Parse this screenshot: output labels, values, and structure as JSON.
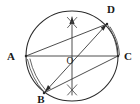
{
  "figure": {
    "kind": "circle-geometry-construction",
    "background_color": "#ffffff",
    "ink_color": "#2b2b2b",
    "width": 140,
    "height": 104,
    "circle": {
      "name": "main-circle",
      "center_x": 72,
      "center_y": 56,
      "radius_x": 46,
      "radius_y": 45
    },
    "points": [
      {
        "id": "A",
        "label": "A",
        "x": 26,
        "y": 56,
        "label_x": 13,
        "label_y": 60
      },
      {
        "id": "B",
        "label": "B",
        "x": 44,
        "y": 93,
        "label_x": 38,
        "label_y": 103
      },
      {
        "id": "C",
        "label": "C",
        "x": 118,
        "y": 56,
        "label_x": 123,
        "label_y": 60
      },
      {
        "id": "D",
        "label": "D",
        "x": 107,
        "y": 24,
        "label_x": 108,
        "label_y": 13
      },
      {
        "id": "O",
        "label": "O",
        "x": 72,
        "y": 56,
        "label_x": 67,
        "label_y": 63
      }
    ],
    "chords": [
      {
        "name": "chord-AC-diameter",
        "from": "A",
        "to": "C",
        "x1": 26,
        "y1": 56,
        "x2": 118,
        "y2": 56
      },
      {
        "name": "chord-AD",
        "from": "A",
        "to": "D",
        "x1": 26,
        "y1": 56,
        "x2": 107,
        "y2": 24
      },
      {
        "name": "chord-BC",
        "from": "B",
        "to": "C",
        "x1": 44,
        "y1": 93,
        "x2": 118,
        "y2": 56
      },
      {
        "name": "chord-BD",
        "from": "B",
        "to": "D",
        "x1": 44,
        "y1": 93,
        "x2": 107,
        "y2": 24
      }
    ],
    "perpendicular_bisector": {
      "name": "vertical-bisector",
      "x": 72,
      "y_top": 16,
      "y_bottom": 96
    },
    "arrowheads": [
      {
        "name": "arrowhead-up-on-bisector",
        "x": 72,
        "y": 21,
        "direction": "up"
      },
      {
        "name": "arrowhead-toward-B",
        "x": 46,
        "y": 91,
        "direction": "down-left"
      },
      {
        "name": "arrowhead-toward-D",
        "x": 105,
        "y": 26,
        "direction": "up-right"
      }
    ],
    "construction_marks": [
      {
        "name": "x-mark-top",
        "x": 72,
        "y": 22,
        "size": 6
      },
      {
        "name": "x-mark-bottom",
        "x": 72,
        "y": 90,
        "size": 6
      },
      {
        "name": "arc-tick-AB",
        "side": "left-lower"
      },
      {
        "name": "arc-tick-DC",
        "side": "right-upper"
      }
    ]
  }
}
